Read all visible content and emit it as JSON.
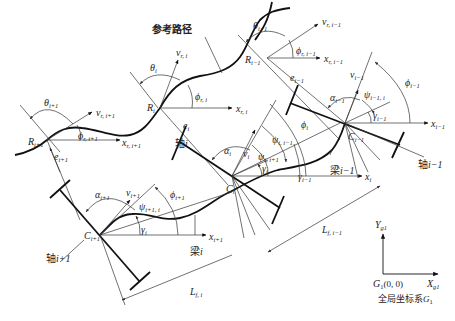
{
  "reference_path_label": "参考路径",
  "global_frame": {
    "caption": "全局坐标系G1",
    "caption_text": "全局坐标系",
    "caption_var": "G",
    "caption_sub": "1",
    "origin_label": "G1(0, 0)",
    "origin_var": "G",
    "origin_sub": "1",
    "origin_coords": "(0, 0)",
    "x_axis": "X",
    "x_axis_sub": "g1",
    "y_axis": "Y",
    "y_axis_sub": "g1"
  },
  "reference_points": [
    {
      "name": "R",
      "sub": "i+1",
      "theta": "θ",
      "theta_sub": "i+1",
      "v": "v",
      "v_sub": "r, i+1",
      "x": "x",
      "x_sub": "r, i+1",
      "phi": "ϕ",
      "phi_sub": "r, i+1",
      "e": "e",
      "e_sub": "i+1"
    },
    {
      "name": "R",
      "sub": "i",
      "theta": "θ",
      "theta_sub": "i",
      "v": "v",
      "v_sub": "r, i",
      "x": "x",
      "x_sub": "r, i",
      "phi": "ϕ",
      "phi_sub": "r, i",
      "e": "e",
      "e_sub": "i"
    },
    {
      "name": "R",
      "sub": "i−1",
      "theta": "θ",
      "theta_sub": "i−1",
      "v": "v",
      "v_sub": "r, i−1",
      "x": "x",
      "x_sub": "r, i−1",
      "phi": "ϕ",
      "phi_sub": "r, i−1",
      "e": "e",
      "e_sub": "i−1"
    }
  ],
  "axle_points": [
    {
      "name": "C",
      "sub": "i+1",
      "axle_label": "轴i+1",
      "axle_text": "轴",
      "axle_var": "i+1",
      "alpha": "α",
      "alpha_sub": "i+1",
      "v": "v",
      "v_sub": "i+1",
      "phi": "ϕ",
      "phi_sub": "i+1",
      "psi": "ψ",
      "psi_sub": "i+1, i",
      "x": "x",
      "x_sub": "i+1",
      "gamma": "γ",
      "gamma_sub": "i"
    },
    {
      "name": "C",
      "sub": "i",
      "axle_label": "轴i",
      "axle_text": "轴",
      "axle_var": "i",
      "alpha": "α",
      "alpha_sub": "i",
      "v": "v",
      "v_sub": "i",
      "phi": "ϕ",
      "phi_sub": "i",
      "psi_a": "ψ",
      "psi_a_sub": "i, i+1",
      "psi_b": "ψ",
      "psi_b_sub": "i, i−1",
      "x": "x",
      "x_sub": "i",
      "gamma": "γ",
      "gamma_sub": "i",
      "gamma2": "γ",
      "gamma2_sub": "i−1"
    },
    {
      "name": "C",
      "sub": "i−1",
      "axle_label": "轴i−1",
      "axle_text": "轴",
      "axle_var": "i−1",
      "alpha": "α",
      "alpha_sub": "i−1",
      "v": "v",
      "v_sub": "i−1",
      "phi": "ϕ",
      "phi_sub": "i−1",
      "psi": "ψ",
      "psi_sub": "i−1, i",
      "x": "x",
      "x_sub": "i−1",
      "gamma": "γ",
      "gamma_sub": "i−1"
    }
  ],
  "beams": [
    {
      "label": "梁i",
      "text": "梁",
      "var": "i"
    },
    {
      "label": "梁i−1",
      "text": "梁",
      "var": "i−1"
    }
  ],
  "lengths": [
    {
      "label": "L",
      "sub": "f, i"
    },
    {
      "label": "L",
      "sub": "f, i−1"
    }
  ],
  "colors": {
    "line": "#111111",
    "thin_line": "#333333",
    "background": "#ffffff"
  }
}
